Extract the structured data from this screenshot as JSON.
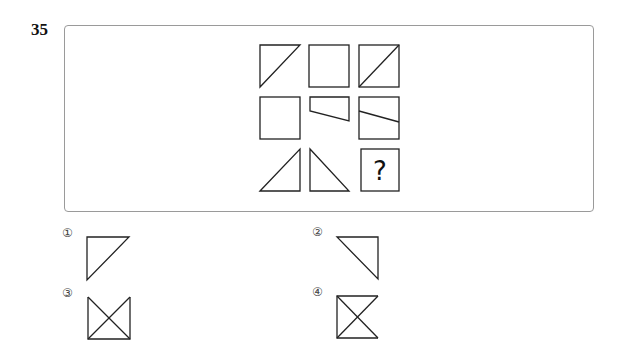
{
  "question": {
    "number": "35",
    "missing_symbol": "?"
  },
  "grid": {
    "rows": 3,
    "cols": 3,
    "cells": [
      {
        "row": 1,
        "col": 1,
        "shape": "right-triangle-top-left"
      },
      {
        "row": 1,
        "col": 2,
        "shape": "square"
      },
      {
        "row": 1,
        "col": 3,
        "shape": "square-with-diagonal"
      },
      {
        "row": 2,
        "col": 1,
        "shape": "square"
      },
      {
        "row": 2,
        "col": 2,
        "shape": "trapezoid-top"
      },
      {
        "row": 2,
        "col": 3,
        "shape": "square-with-slanted-line"
      },
      {
        "row": 3,
        "col": 1,
        "shape": "right-triangle-bottom-right"
      },
      {
        "row": 3,
        "col": 2,
        "shape": "right-triangle-bottom-left"
      },
      {
        "row": 3,
        "col": 3,
        "shape": "question-box"
      }
    ]
  },
  "options": [
    {
      "label": "①",
      "shape": "right-triangle-top-left"
    },
    {
      "label": "②",
      "shape": "right-triangle-top-right"
    },
    {
      "label": "③",
      "shape": "open-top-square-with-x"
    },
    {
      "label": "④",
      "shape": "open-right-square-with-x"
    }
  ],
  "colors": {
    "stroke": "#222222",
    "frame": "#9a9a9a"
  }
}
